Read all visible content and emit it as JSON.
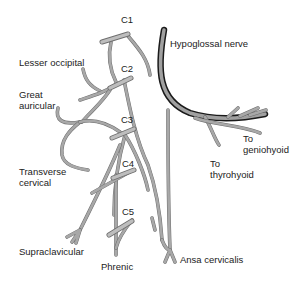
{
  "diagram": {
    "colors": {
      "nerve": "#a8a8a8",
      "nerve_outline": "#6e6e6e",
      "hypoglossal_outline": "#1a1a1a",
      "text": "#222222",
      "background": "#ffffff"
    },
    "roots": [
      {
        "id": "c1",
        "label": "C1"
      },
      {
        "id": "c2",
        "label": "C2"
      },
      {
        "id": "c3",
        "label": "C3"
      },
      {
        "id": "c4",
        "label": "C4"
      },
      {
        "id": "c5",
        "label": "C5"
      }
    ],
    "labels": {
      "hypoglossal": "Hypoglossal nerve",
      "lesser_occipital": "Lesser occipital",
      "great_auricular_1": "Great",
      "great_auricular_2": "auricular",
      "transverse_cervical_1": "Transverse",
      "transverse_cervical_2": "cervical",
      "supraclavicular": "Supraclavicular",
      "phrenic": "Phrenic",
      "ansa_cervicalis": "Ansa cervicalis",
      "to_geniohyoid_1": "To",
      "to_geniohyoid_2": "geniohyoid",
      "to_thyrohyoid_1": "To",
      "to_thyrohyoid_2": "thyrohyoid"
    }
  }
}
